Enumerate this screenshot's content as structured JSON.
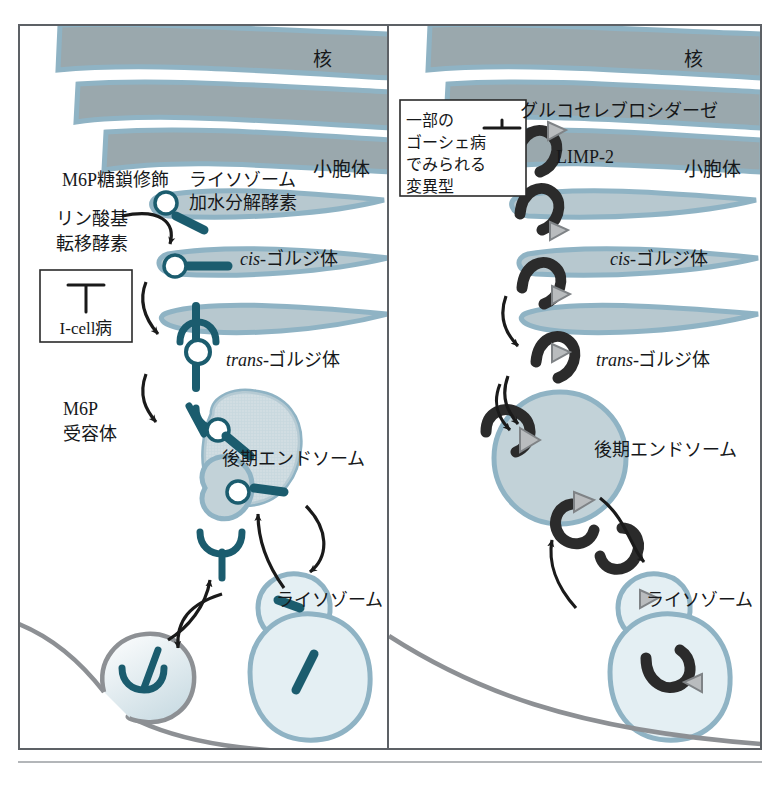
{
  "figure": {
    "title_visible": false,
    "background": "#ffffff",
    "frame_color": "#5d6166",
    "panels": [
      {
        "id": "left",
        "name": "M6P pathway panel",
        "labels": {
          "nucleus": "核",
          "er": "小胞体",
          "m6p_glycan": "M6P糖鎖修飾",
          "lysosomal_hydrolase_line1": "ライソゾーム",
          "lysosomal_hydrolase_line2": "加水分解酵素",
          "phosphotransferase_line1": "リン酸基",
          "phosphotransferase_line2": "転移酵素",
          "cis_golgi_prefix": "cis-",
          "cis_golgi_body": "ゴルジ体",
          "trans_golgi_prefix": "trans-",
          "trans_golgi_body": "ゴルジ体",
          "m6p_receptor_line1": "M6P",
          "m6p_receptor_line2": "受容体",
          "late_endosome": "後期エンドソーム",
          "lysosome": "ライソゾーム"
        },
        "disease_box": {
          "label": "I-cell病",
          "symbol": "inhibition-t-bar"
        }
      },
      {
        "id": "right",
        "name": "Glucocerebrosidase pathway panel",
        "labels": {
          "nucleus": "核",
          "er": "小胞体",
          "glucocerebrosidase": "グルコセレブロシダーゼ",
          "limp2": "LIMP-2",
          "cis_golgi_prefix": "cis-",
          "cis_golgi_body": "ゴルジ体",
          "trans_golgi_prefix": "trans-",
          "trans_golgi_body": "ゴルジ体",
          "late_endosome": "後期エンドソーム",
          "lysosome": "ライソゾーム"
        },
        "disease_box": {
          "line1": "一部の",
          "line2": "ゴーシェ病",
          "line3": "でみられる",
          "line4": "変異型",
          "symbol": "inhibition-t-bar"
        }
      }
    ],
    "colors": {
      "nucleus_fill": "#9aa8ad",
      "membrane_edge": "#8fb3c4",
      "endosome_fill": "#c2d2d8",
      "lysosome_fill": "#e4eff3",
      "enzyme_bar": "#1b5c6e",
      "enzyme_hook": "#2b2b2b",
      "limp2_triangle": "#8b8f92",
      "plasma_membrane": "#8d9094",
      "arrow": "#1a1a1a"
    }
  }
}
